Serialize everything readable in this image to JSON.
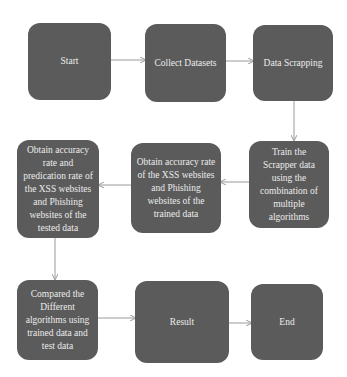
{
  "diagram": {
    "colors": {
      "background": "#ffffff",
      "node_fill": "#5b5b5b",
      "node_text": "#ececec",
      "edge": "#9a9a9a"
    },
    "nodes": [
      {
        "id": "start",
        "label": "Start"
      },
      {
        "id": "collect",
        "label": "Collect Datasets"
      },
      {
        "id": "scrap",
        "label": "Data Scrapping"
      },
      {
        "id": "train",
        "label": "Train the Scrapper data using the combination of multiple algorithms"
      },
      {
        "id": "trained",
        "label": "Obtain accuracy rate of the XSS websites and Phishing websites of the trained data"
      },
      {
        "id": "tested",
        "label": "Obtain accuracy rate and predication rate of the XSS websites and Phishing websites of the tested data"
      },
      {
        "id": "compare",
        "label": "Compared the Different algorithms using trained data and test data"
      },
      {
        "id": "result",
        "label": "Result"
      },
      {
        "id": "end",
        "label": "End"
      }
    ],
    "edges": [
      {
        "from": "start",
        "to": "collect"
      },
      {
        "from": "collect",
        "to": "scrap"
      },
      {
        "from": "scrap",
        "to": "train"
      },
      {
        "from": "train",
        "to": "trained"
      },
      {
        "from": "trained",
        "to": "tested"
      },
      {
        "from": "tested",
        "to": "compare"
      },
      {
        "from": "compare",
        "to": "result"
      },
      {
        "from": "result",
        "to": "end"
      }
    ]
  }
}
